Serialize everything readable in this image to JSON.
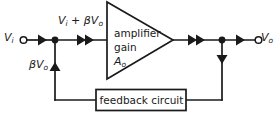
{
  "diagram": {
    "type": "block-diagram",
    "background_color": "#ffffff",
    "line_color": "#1a1a1a",
    "text_color": "#1a1a1a",
    "terminals": {
      "input": {
        "label_main": "V",
        "label_sub": "i",
        "marker": "open-circle-terminal"
      },
      "output": {
        "label_main": "V",
        "label_sub": "o",
        "marker": "open-circle-terminal"
      }
    },
    "signals": {
      "summing_node": {
        "text_a": "V",
        "sub_a": "i",
        "operator": " + ",
        "text_b": "βV",
        "sub_b": "o"
      },
      "feedback_signal": {
        "text": "βV",
        "sub": "o"
      }
    },
    "amplifier": {
      "shape": "triangle",
      "line1": "amplifier",
      "line2": "gain",
      "line3_main": "A",
      "line3_sub": "o"
    },
    "feedback_block": {
      "shape": "rectangle",
      "label": "feedback circuit"
    },
    "arrow_markers": [
      {
        "name": "input-arrow",
        "style": "single-chevron"
      },
      {
        "name": "summing-arrow",
        "style": "double-chevron"
      },
      {
        "name": "amp-output-arrow",
        "style": "double-chevron"
      },
      {
        "name": "output-arrow",
        "style": "single-chevron"
      },
      {
        "name": "feedback-down-arrow",
        "style": "single-chevron-down"
      },
      {
        "name": "feedback-up-arrow",
        "style": "single-chevron-up"
      }
    ]
  }
}
